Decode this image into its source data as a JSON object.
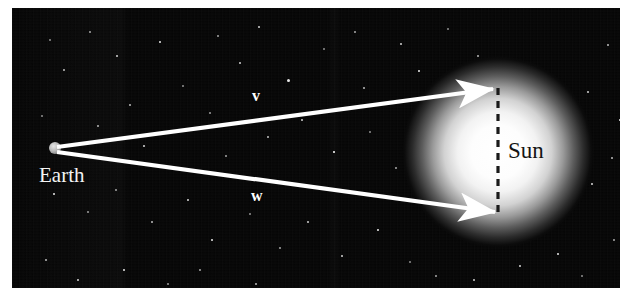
{
  "figure": {
    "kind": "astronomy-vector-diagram",
    "background_color": "#050505",
    "frame": {
      "x": 12,
      "y": 8,
      "width": 608,
      "height": 280
    }
  },
  "labels": {
    "earth": "Earth",
    "sun": "Sun",
    "vector_v": "v",
    "vector_w": "w"
  },
  "bodies": {
    "earth": {
      "center_x": 55,
      "center_y": 148,
      "radius": 6,
      "color": "#b9b9b9"
    },
    "sun": {
      "center_x": 498,
      "center_y": 152,
      "glow_radius": 96,
      "disc_color": "#ffffff"
    }
  },
  "vectors": [
    {
      "name": "v",
      "label": "v",
      "from_x": 57,
      "from_y": 147,
      "to_x": 493,
      "to_y": 89,
      "label_x": 252,
      "label_y": 88,
      "color": "#ffffff"
    },
    {
      "name": "w",
      "label": "w",
      "from_x": 57,
      "from_y": 152,
      "to_x": 495,
      "to_y": 212,
      "label_x": 251,
      "label_y": 188,
      "color": "#ffffff"
    }
  ],
  "dashed_line": {
    "name": "sun-diameter-line",
    "x": 498,
    "y_top": 88,
    "y_bottom": 214,
    "color": "#1a1a1a",
    "dash": "7 6"
  },
  "stars": [
    {
      "x": 38,
      "y": 32,
      "r": 1.1
    },
    {
      "x": 78,
      "y": 24,
      "r": 1.0
    },
    {
      "x": 52,
      "y": 62,
      "r": 0.9
    },
    {
      "x": 105,
      "y": 48,
      "r": 1.3
    },
    {
      "x": 148,
      "y": 34,
      "r": 1.2
    },
    {
      "x": 171,
      "y": 78,
      "r": 0.9
    },
    {
      "x": 206,
      "y": 28,
      "r": 1.1
    },
    {
      "x": 228,
      "y": 55,
      "r": 0.8
    },
    {
      "x": 247,
      "y": 19,
      "r": 1.0
    },
    {
      "x": 276,
      "y": 72,
      "r": 1.5
    },
    {
      "x": 312,
      "y": 41,
      "r": 1.0
    },
    {
      "x": 343,
      "y": 24,
      "r": 0.9
    },
    {
      "x": 352,
      "y": 80,
      "r": 1.2
    },
    {
      "x": 389,
      "y": 36,
      "r": 1.1
    },
    {
      "x": 407,
      "y": 63,
      "r": 0.9
    },
    {
      "x": 436,
      "y": 21,
      "r": 1.0
    },
    {
      "x": 466,
      "y": 48,
      "r": 0.8
    },
    {
      "x": 596,
      "y": 37,
      "r": 1.4
    },
    {
      "x": 576,
      "y": 84,
      "r": 1.0
    },
    {
      "x": 608,
      "y": 112,
      "r": 0.9
    },
    {
      "x": 30,
      "y": 108,
      "r": 1.0
    },
    {
      "x": 86,
      "y": 118,
      "r": 0.8
    },
    {
      "x": 118,
      "y": 97,
      "r": 1.1
    },
    {
      "x": 132,
      "y": 138,
      "r": 0.9
    },
    {
      "x": 167,
      "y": 122,
      "r": 1.0
    },
    {
      "x": 198,
      "y": 105,
      "r": 0.8
    },
    {
      "x": 214,
      "y": 148,
      "r": 1.1
    },
    {
      "x": 256,
      "y": 129,
      "r": 0.9
    },
    {
      "x": 290,
      "y": 112,
      "r": 1.0
    },
    {
      "x": 322,
      "y": 144,
      "r": 0.8
    },
    {
      "x": 358,
      "y": 124,
      "r": 1.1
    },
    {
      "x": 384,
      "y": 160,
      "r": 0.9
    },
    {
      "x": 600,
      "y": 150,
      "r": 1.0
    },
    {
      "x": 580,
      "y": 176,
      "r": 0.9
    },
    {
      "x": 42,
      "y": 186,
      "r": 1.0
    },
    {
      "x": 76,
      "y": 204,
      "r": 0.8
    },
    {
      "x": 104,
      "y": 182,
      "r": 1.1
    },
    {
      "x": 140,
      "y": 214,
      "r": 1.0
    },
    {
      "x": 176,
      "y": 192,
      "r": 0.9
    },
    {
      "x": 200,
      "y": 232,
      "r": 1.2
    },
    {
      "x": 238,
      "y": 206,
      "r": 0.9
    },
    {
      "x": 268,
      "y": 240,
      "r": 1.0
    },
    {
      "x": 296,
      "y": 214,
      "r": 0.8
    },
    {
      "x": 330,
      "y": 248,
      "r": 1.1
    },
    {
      "x": 366,
      "y": 222,
      "r": 0.9
    },
    {
      "x": 398,
      "y": 254,
      "r": 1.0
    },
    {
      "x": 424,
      "y": 268,
      "r": 0.9
    },
    {
      "x": 462,
      "y": 272,
      "r": 0.8
    },
    {
      "x": 508,
      "y": 258,
      "r": 0.9
    },
    {
      "x": 546,
      "y": 246,
      "r": 1.1
    },
    {
      "x": 570,
      "y": 268,
      "r": 1.0
    },
    {
      "x": 602,
      "y": 232,
      "r": 0.9
    },
    {
      "x": 34,
      "y": 252,
      "r": 1.0
    },
    {
      "x": 66,
      "y": 272,
      "r": 0.9
    },
    {
      "x": 112,
      "y": 262,
      "r": 1.0
    },
    {
      "x": 156,
      "y": 276,
      "r": 0.8
    },
    {
      "x": 188,
      "y": 262,
      "r": 0.9
    },
    {
      "x": 244,
      "y": 276,
      "r": 1.0
    }
  ]
}
